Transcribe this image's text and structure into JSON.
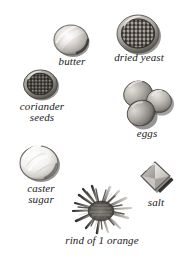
{
  "page": {
    "kind": "ingredient-illustration-plate",
    "background_color": "#ffffff",
    "width": 187,
    "height": 266,
    "palette": {
      "ink": "#1a1a1a",
      "shadow": "#4a4a4a",
      "midtone": "#8c8c8c",
      "highlight": "#f2f2f2",
      "seed_dark": "#3d3a36",
      "egg_shell": "#b9b5b0",
      "crystal": "#d9d9d9"
    }
  },
  "ingredients": [
    {
      "id": "butter",
      "label": "butter",
      "icon": "butter-pat-disc-icon",
      "shape": "rounded-disc",
      "tone": "pale-cream-grey",
      "position": {
        "x": 50,
        "y": 22
      }
    },
    {
      "id": "dried_yeast",
      "label": "dried yeast",
      "icon": "dried-yeast-granules-icon",
      "shape": "round-mound-of-granules",
      "tone": "dark-speckled-grey",
      "position": {
        "x": 113,
        "y": 12
      }
    },
    {
      "id": "coriander_seeds",
      "label": "coriander\nseeds",
      "icon": "coriander-seeds-pile-icon",
      "shape": "round-pile-of-small-seeds",
      "tone": "dark-grey-brown",
      "position": {
        "x": 20,
        "y": 68
      }
    },
    {
      "id": "eggs",
      "label": "eggs",
      "icon": "three-eggs-cluster-icon",
      "shape": "three-overlapping-ovals",
      "tone": "mid-grey-shell",
      "position": {
        "x": 118,
        "y": 78
      }
    },
    {
      "id": "caster_sugar",
      "label": "caster\nsugar",
      "icon": "caster-sugar-mound-icon",
      "shape": "round-glossy-mound",
      "tone": "near-white",
      "position": {
        "x": 17,
        "y": 143
      }
    },
    {
      "id": "salt",
      "label": "salt",
      "icon": "salt-crystal-cube-icon",
      "shape": "diamond-cube-crystal",
      "tone": "light-grey-facets",
      "position": {
        "x": 134,
        "y": 157
      }
    },
    {
      "id": "rind_of_orange",
      "label": "rind of 1 orange",
      "icon": "grated-orange-rind-icon",
      "shape": "spiky-shredded-pile",
      "tone": "mid-dark-grey",
      "position": {
        "x": 70,
        "y": 183
      }
    }
  ]
}
